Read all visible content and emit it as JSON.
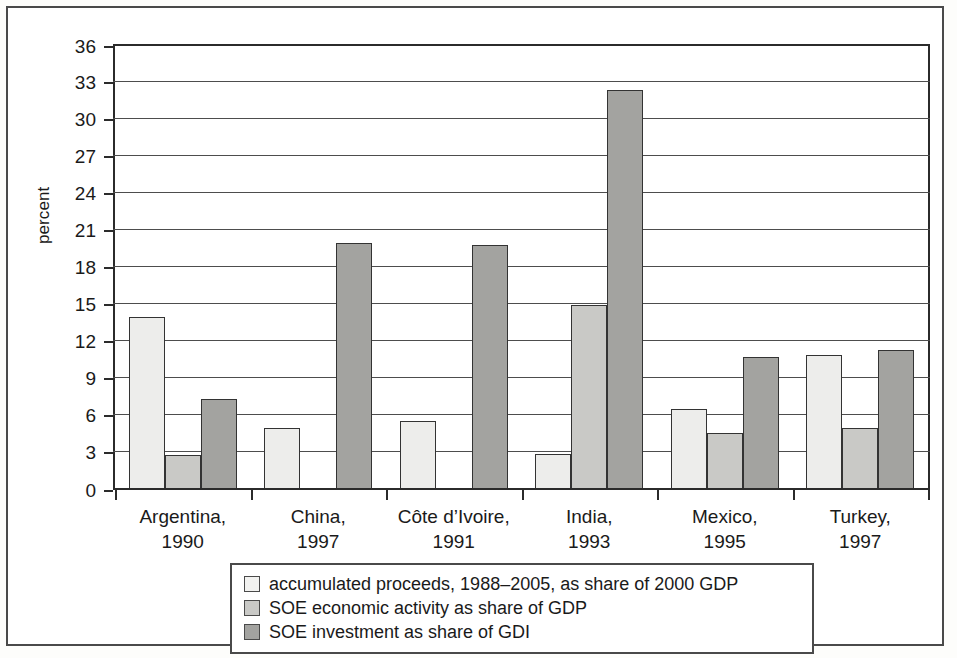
{
  "chart_data": {
    "type": "bar",
    "title": "",
    "subtitle": "",
    "xlabel": "",
    "ylabel": "percent",
    "ylim": [
      0,
      36
    ],
    "ytick_step": 3,
    "yticks": [
      36,
      33,
      30,
      27,
      24,
      21,
      18,
      15,
      12,
      9,
      6,
      3,
      0
    ],
    "grid": true,
    "legend_position": "bottom",
    "categories": [
      "Argentina, 1990",
      "China, 1997",
      "Côte d’Ivoire, 1991",
      "India, 1993",
      "Mexico, 1995",
      "Turkey, 1997"
    ],
    "category_lines": [
      [
        "Argentina,",
        "1990"
      ],
      [
        "China,",
        "1997"
      ],
      [
        "Côte d’Ivoire,",
        "1991"
      ],
      [
        "India,",
        "1993"
      ],
      [
        "Mexico,",
        "1995"
      ],
      [
        "Turkey,",
        "1997"
      ]
    ],
    "series": [
      {
        "name": "accumulated proceeds, 1988–2005, as share of 2000 GDP",
        "color": "#ededeb",
        "values": [
          13.9,
          4.9,
          5.4,
          2.75,
          6.4,
          10.8
        ]
      },
      {
        "name": "SOE economic activity as share of GDP",
        "color": "#c9c9c6",
        "values": [
          2.7,
          null,
          null,
          14.8,
          4.5,
          4.85
        ]
      },
      {
        "name": "SOE investment as share of GDI",
        "color": "#a3a3a0",
        "values": [
          7.2,
          19.9,
          19.7,
          32.3,
          10.6,
          11.2
        ]
      }
    ]
  },
  "legend": {
    "items": [
      {
        "swatch": "light-gray-swatch",
        "label": "accumulated proceeds, 1988–2005, as share of 2000 GDP"
      },
      {
        "swatch": "medium-gray-swatch",
        "label": "SOE economic activity as share of GDP"
      },
      {
        "swatch": "dark-gray-swatch",
        "label": "SOE investment as share of GDI"
      }
    ]
  },
  "colors": {
    "series_light": "#ededeb",
    "series_medium": "#c9c9c6",
    "series_dark": "#a3a3a0",
    "axis": "#2b2b2b",
    "grid": "#4d4d4d",
    "frame": "#4a4a4a"
  }
}
